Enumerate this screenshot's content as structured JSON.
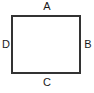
{
  "figure": {
    "kind": "labelled-rectangle-diagram",
    "canvas": {
      "width": 94,
      "height": 93,
      "background_color": "#ffffff"
    },
    "shape": {
      "name": "rectangle",
      "x": 11,
      "y": 15,
      "width": 70,
      "height": 59,
      "stroke_color": "#333333",
      "stroke_width": 2,
      "fill_color": "#ffffff"
    },
    "labels": {
      "top": "A",
      "right": "B",
      "bottom": "C",
      "left": "D"
    },
    "label_color": "#1a1a1a"
  }
}
